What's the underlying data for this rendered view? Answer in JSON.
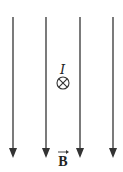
{
  "diagram": {
    "type": "magnetic-field-with-current",
    "field_lines": {
      "count": 4,
      "direction": "down",
      "x_positions": [
        13,
        46,
        80,
        113
      ],
      "y_start": 17,
      "y_end": 158,
      "color": "#333333"
    },
    "current": {
      "label": "I",
      "symbol": "⊗",
      "meaning": "current into page"
    },
    "field_label": {
      "text": "B",
      "vector_arrow": true
    }
  }
}
